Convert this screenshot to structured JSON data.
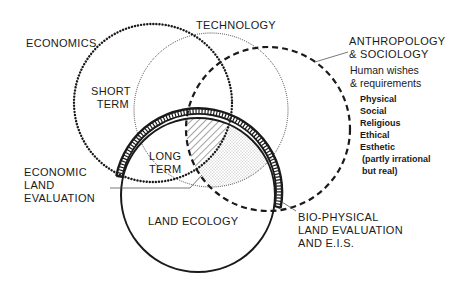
{
  "labels": {
    "economics": "ECONOMICS",
    "technology": "TECHNOLOGY",
    "anthropology_line1": "ANTHROPOLOGY",
    "anthropology_line2": "& SOCIOLOGY",
    "human_wishes_line1": "Human wishes",
    "human_wishes_line2": "& requirements",
    "requirements": [
      "Physical",
      "Social",
      "Religious",
      "Ethical",
      "Esthetic",
      "(partly irrational",
      " but real)"
    ],
    "short_term_line1": "SHORT",
    "short_term_line2": "TERM",
    "long_term_line1": "LONG",
    "long_term_line2": "TERM",
    "economic_land_eval": [
      "ECONOMIC",
      "LAND",
      "EVALUATION"
    ],
    "land_ecology": "LAND ECOLOGY",
    "bio_physical": [
      "BIO-PHYSICAL",
      "LAND EVALUATION",
      "AND E.I.S."
    ]
  },
  "circles": {
    "economics": {
      "cx": 153,
      "cy": 103,
      "r": 79,
      "style": "heavy-dotted"
    },
    "technology": {
      "cx": 211,
      "cy": 110,
      "r": 77,
      "style": "fine-dotted"
    },
    "anthropology": {
      "cx": 268,
      "cy": 129,
      "r": 82,
      "style": "dashed"
    },
    "land_ecology": {
      "cx": 198,
      "cy": 195,
      "r": 77,
      "style": "solid"
    }
  },
  "colors": {
    "ink": "#1a1a1a",
    "background": "#ffffff"
  }
}
